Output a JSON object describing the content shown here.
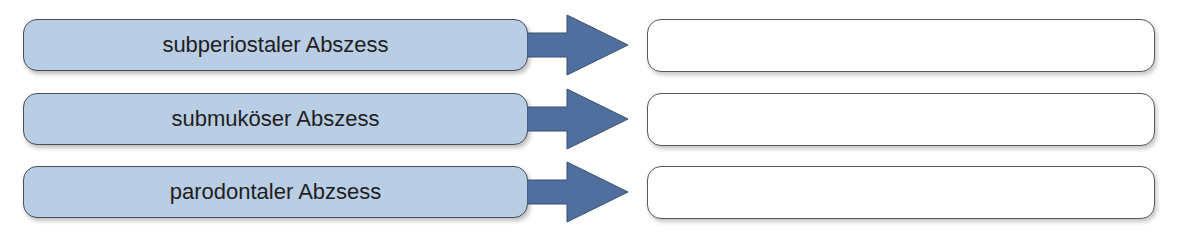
{
  "diagram": {
    "type": "matching-exercise",
    "colors": {
      "term_fill": "#b9cde4",
      "arrow_fill": "#4f6f9f",
      "answer_fill": "#ffffff",
      "border": "#4a4d57"
    },
    "rows": [
      {
        "term": "subperiostaler Abszess",
        "answer": ""
      },
      {
        "term": "submuköser Abszess",
        "answer": ""
      },
      {
        "term": "parodontaler Abzsess",
        "answer": ""
      }
    ]
  }
}
